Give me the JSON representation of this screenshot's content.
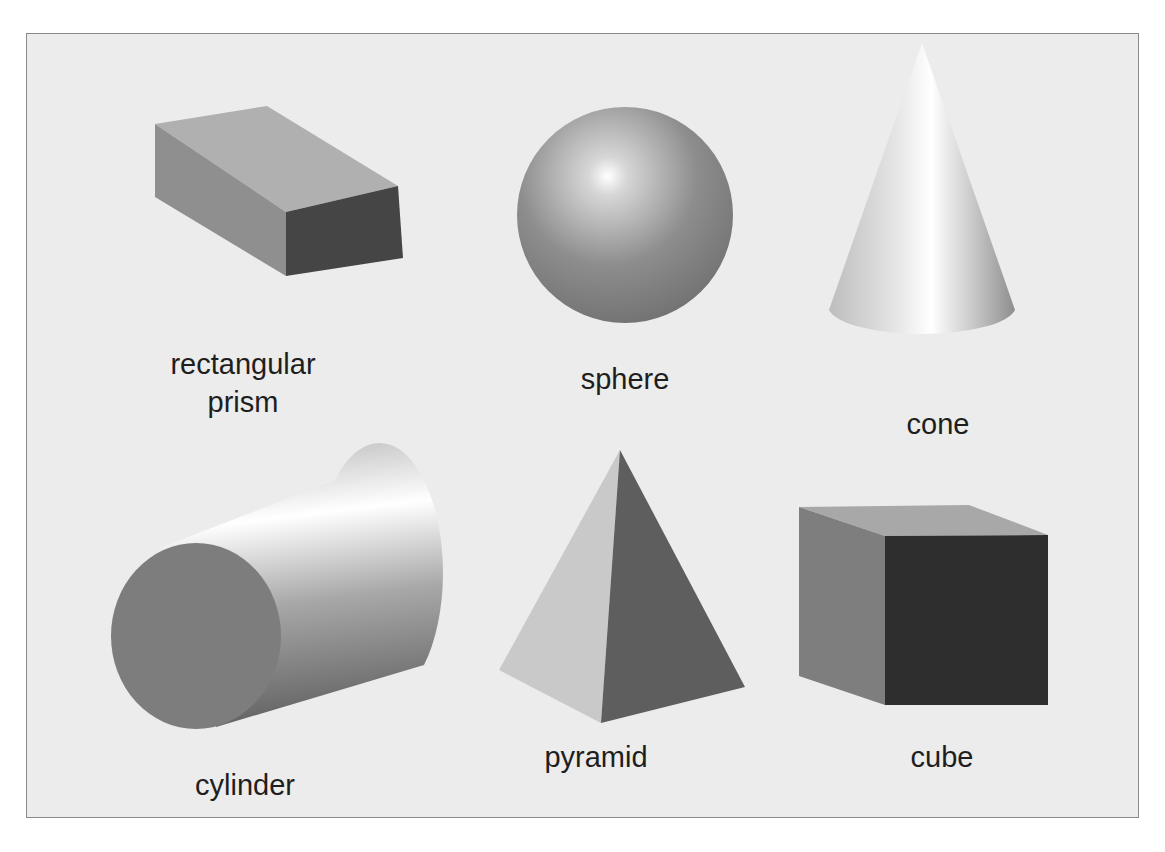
{
  "diagram": {
    "background_color": "#ececec",
    "border_color": "#8a8a8a",
    "shapes": [
      {
        "id": "rectangular-prism",
        "label": "rectangular\nprism",
        "row": 1,
        "col": 1
      },
      {
        "id": "sphere",
        "label": "sphere",
        "row": 1,
        "col": 2
      },
      {
        "id": "cone",
        "label": "cone",
        "row": 1,
        "col": 3
      },
      {
        "id": "cylinder",
        "label": "cylinder",
        "row": 2,
        "col": 1
      },
      {
        "id": "pyramid",
        "label": "pyramid",
        "row": 2,
        "col": 2
      },
      {
        "id": "cube",
        "label": "cube",
        "row": 2,
        "col": 3
      }
    ]
  }
}
